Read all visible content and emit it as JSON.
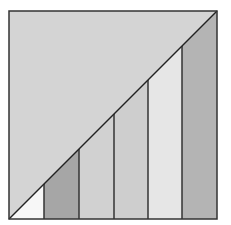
{
  "diagram": {
    "type": "square-with-diagonal-and-vertical-strips",
    "square": {
      "x": 9,
      "y": 11,
      "width": 208,
      "height": 208,
      "stroke": "#333333",
      "stroke_width": 1.5
    },
    "upper_triangle": {
      "fill": "#d4d4d4"
    },
    "diagonal": {
      "from": [
        9,
        219
      ],
      "to": [
        217,
        11
      ],
      "stroke": "#222222",
      "stroke_width": 1.5
    },
    "strips": [
      {
        "index": 1,
        "x0": 9,
        "x1": 44,
        "fill": "#f7f7f7"
      },
      {
        "index": 2,
        "x0": 44,
        "x1": 79,
        "fill": "#a6a6a6"
      },
      {
        "index": 3,
        "x0": 79,
        "x1": 114,
        "fill": "#d1d1d1"
      },
      {
        "index": 4,
        "x0": 114,
        "x1": 148,
        "fill": "#cecece"
      },
      {
        "index": 5,
        "x0": 148,
        "x1": 182,
        "fill": "#e6e6e6"
      },
      {
        "index": 6,
        "x0": 182,
        "x1": 217,
        "fill": "#b4b4b4"
      }
    ],
    "divider_stroke": "#333333"
  }
}
